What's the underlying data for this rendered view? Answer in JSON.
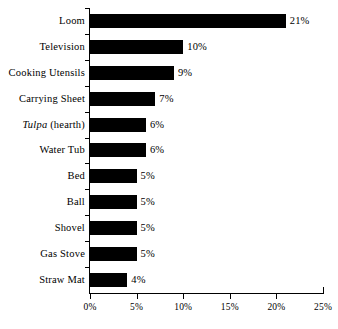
{
  "chart_data": {
    "type": "bar",
    "orientation": "horizontal",
    "title": "",
    "subtitle": "",
    "xlabel": "",
    "ylabel": "",
    "xlim": [
      0,
      25
    ],
    "grid": false,
    "legend": null,
    "xticks": [
      "0%",
      "5%",
      "10%",
      "15%",
      "20%",
      "25%"
    ],
    "xtick_values": [
      0,
      5,
      10,
      15,
      20,
      25
    ],
    "bar_color": "#000000",
    "axis_color": "#000000",
    "background": "#ffffff",
    "categories": [
      "Loom",
      "Television",
      "Cooking Utensils",
      "Carrying Sheet",
      "Tulpa (hearth)",
      "Water  Tub",
      "Bed",
      "Ball",
      "Shovel",
      "Gas Stove",
      "Straw Mat"
    ],
    "values": [
      21,
      10,
      9,
      7,
      6,
      6,
      5,
      5,
      5,
      5,
      4
    ],
    "data_labels": [
      "21%",
      "10%",
      "9%",
      "7%",
      "6%",
      "6%",
      "5%",
      "5%",
      "5%",
      "5%",
      "4%"
    ],
    "items": [
      {
        "label": "Loom",
        "label_italic": "",
        "label_rest": "Loom",
        "value": 21,
        "data_label": "21%"
      },
      {
        "label": "Television",
        "label_italic": "",
        "label_rest": "Television",
        "value": 10,
        "data_label": "10%"
      },
      {
        "label": "Cooking Utensils",
        "label_italic": "",
        "label_rest": "Cooking Utensils",
        "value": 9,
        "data_label": "9%"
      },
      {
        "label": "Carrying Sheet",
        "label_italic": "",
        "label_rest": "Carrying Sheet",
        "value": 7,
        "data_label": "7%"
      },
      {
        "label": "Tulpa (hearth)",
        "label_italic": "Tulpa",
        "label_rest": " (hearth)",
        "value": 6,
        "data_label": "6%"
      },
      {
        "label": "Water  Tub",
        "label_italic": "",
        "label_rest": "Water  Tub",
        "value": 6,
        "data_label": "6%"
      },
      {
        "label": "Bed",
        "label_italic": "",
        "label_rest": "Bed",
        "value": 5,
        "data_label": "5%"
      },
      {
        "label": "Ball",
        "label_italic": "",
        "label_rest": "Ball",
        "value": 5,
        "data_label": "5%"
      },
      {
        "label": "Shovel",
        "label_italic": "",
        "label_rest": "Shovel",
        "value": 5,
        "data_label": "5%"
      },
      {
        "label": "Gas Stove",
        "label_italic": "",
        "label_rest": "Gas Stove",
        "value": 5,
        "data_label": "5%"
      },
      {
        "label": "Straw Mat",
        "label_italic": "",
        "label_rest": "Straw Mat",
        "value": 4,
        "data_label": "4%"
      }
    ]
  }
}
